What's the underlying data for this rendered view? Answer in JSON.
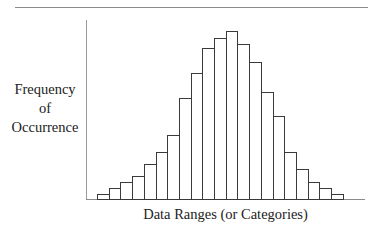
{
  "chart_data": {
    "type": "bar",
    "subtype": "histogram",
    "title": "",
    "xlabel": "Data Ranges (or Categories)",
    "ylabel_lines": [
      "Frequency",
      "of",
      "Occurrence"
    ],
    "ylabel": "Frequency of Occurrence",
    "categories": [
      "1",
      "2",
      "3",
      "4",
      "5",
      "6",
      "7",
      "8",
      "9",
      "10",
      "11",
      "12",
      "13",
      "14",
      "15",
      "16",
      "17",
      "18",
      "19",
      "20",
      "21"
    ],
    "values": [
      5,
      11,
      17,
      23,
      35,
      47,
      64,
      101,
      126,
      151,
      161,
      168,
      155,
      137,
      107,
      83,
      47,
      30,
      17,
      11,
      5
    ],
    "ylim": [
      0,
      180
    ],
    "grid": false,
    "legend": null,
    "tick_labels": "none",
    "bar_fill": "#ffffff",
    "bar_stroke": "#3a3a3a"
  },
  "labels": {
    "ylabel_line1": "Frequency",
    "ylabel_line2": "of",
    "ylabel_line3": "Occurrence",
    "xlabel": "Data Ranges (or Categories)"
  },
  "layout": {
    "plot_left": 97,
    "baseline_y": 199,
    "bar_width": 11.7,
    "px_per_unit": 1.0
  }
}
